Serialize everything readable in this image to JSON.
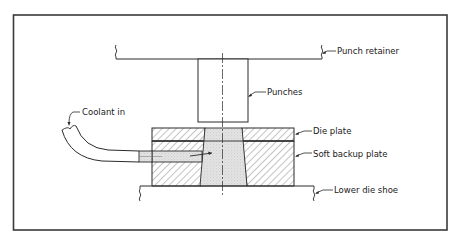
{
  "diagram": {
    "type": "mechanical-section",
    "labels": {
      "punch_retainer": "Punch retainer",
      "punches": "Punches",
      "coolant_in": "Coolant in",
      "die_plate": "Die plate",
      "soft_backup_plate": "Soft backup plate",
      "lower_die_shoe": "Lower die shoe"
    },
    "colors": {
      "line": "#2a2a2a",
      "frame": "#3a3a3a",
      "hatch": "#555555",
      "stipple": "#d9d9d9"
    }
  }
}
